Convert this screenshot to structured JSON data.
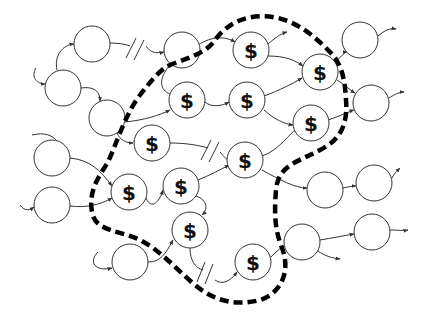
{
  "diagram": {
    "marked_symbol": "$",
    "colors": {
      "stroke": "#333333",
      "boundary": "#000000",
      "background": "#ffffff"
    },
    "node_radius": 18,
    "nodes": [
      {
        "id": "n1",
        "x": 92,
        "y": 44,
        "label": ""
      },
      {
        "id": "n2",
        "x": 63,
        "y": 88,
        "label": ""
      },
      {
        "id": "n3",
        "x": 107,
        "y": 118,
        "label": ""
      },
      {
        "id": "n4",
        "x": 182,
        "y": 50,
        "label": ""
      },
      {
        "id": "n5",
        "x": 52,
        "y": 158,
        "label": ""
      },
      {
        "id": "n6",
        "x": 52,
        "y": 205,
        "label": ""
      },
      {
        "id": "n7",
        "x": 130,
        "y": 262,
        "label": ""
      },
      {
        "id": "d1",
        "x": 187,
        "y": 100,
        "label": "$"
      },
      {
        "id": "d2",
        "x": 152,
        "y": 143,
        "label": "$"
      },
      {
        "id": "d3",
        "x": 129,
        "y": 192,
        "label": "$"
      },
      {
        "id": "d4",
        "x": 181,
        "y": 186,
        "label": "$"
      },
      {
        "id": "d5",
        "x": 190,
        "y": 230,
        "label": "$"
      },
      {
        "id": "d6",
        "x": 251,
        "y": 50,
        "label": "$"
      },
      {
        "id": "d7",
        "x": 247,
        "y": 100,
        "label": "$"
      },
      {
        "id": "d8",
        "x": 245,
        "y": 160,
        "label": "$"
      },
      {
        "id": "d9",
        "x": 320,
        "y": 72,
        "label": "$"
      },
      {
        "id": "d10",
        "x": 311,
        "y": 123,
        "label": "$"
      },
      {
        "id": "d11",
        "x": 253,
        "y": 262,
        "label": "$"
      },
      {
        "id": "n8",
        "x": 360,
        "y": 40,
        "label": ""
      },
      {
        "id": "n9",
        "x": 371,
        "y": 103,
        "label": ""
      },
      {
        "id": "n10",
        "x": 325,
        "y": 190,
        "label": ""
      },
      {
        "id": "n11",
        "x": 374,
        "y": 183,
        "label": ""
      },
      {
        "id": "n12",
        "x": 302,
        "y": 242,
        "label": ""
      },
      {
        "id": "n13",
        "x": 372,
        "y": 232,
        "label": ""
      }
    ],
    "breaks": [
      {
        "x": 141,
        "y": 46
      },
      {
        "x": 214,
        "y": 150
      },
      {
        "x": 210,
        "y": 275
      }
    ]
  }
}
